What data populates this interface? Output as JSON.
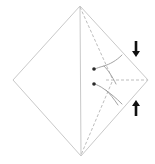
{
  "figure": {
    "title": "Origami fold step diagram",
    "caption": "Diamond-shaped paper with right flap folded to center",
    "background_color": "#ffffff",
    "canvas": {
      "width": 155,
      "height": 164
    }
  },
  "style": {
    "outline_color": "#c9c9c9",
    "crease_color": "#c9c9c9",
    "dashed_color": "#bdbdbd",
    "motion_color": "#9a9a9a",
    "arrow_color": "#111111",
    "outline_width": 1,
    "dash_pattern": "3 2"
  },
  "shape": {
    "name": "diamond",
    "label": "square rotated 45 degrees",
    "vertices": {
      "top": {
        "x": 80,
        "y": 6,
        "label": "top vertex"
      },
      "right": {
        "x": 148,
        "y": 80,
        "label": "right vertex"
      },
      "bottom": {
        "x": 81,
        "y": 156,
        "label": "bottom vertex"
      },
      "left": {
        "x": 13,
        "y": 80,
        "label": "left vertex"
      }
    },
    "points_path": "80,6 148,80 81,156 13,80"
  },
  "creases": [
    {
      "name": "vertical-center-crease",
      "label": "vertical center fold line",
      "style": "solid",
      "x1": 80,
      "y1": 6,
      "x2": 81,
      "y2": 156
    },
    {
      "name": "upper-diagonal-crease",
      "label": "upper dashed diagonal fold",
      "style": "dashed",
      "x1": 80,
      "y1": 7,
      "x2": 112,
      "y2": 78
    },
    {
      "name": "lower-diagonal-crease",
      "label": "lower dashed diagonal fold",
      "style": "dashed",
      "x1": 112,
      "y1": 82,
      "x2": 81,
      "y2": 155
    },
    {
      "name": "horizontal-dashed-crease",
      "label": "horizontal dashed fold to right vertex",
      "style": "dashed",
      "x1": 106,
      "y1": 80,
      "x2": 147,
      "y2": 80
    }
  ],
  "motion_arrows": [
    {
      "name": "upper-curved-fold-arrow",
      "label": "upper curved fold arrow pointing left",
      "path": "M 122 55 C 116 61 110 64 104 66 C 100 67 97 68 95 69",
      "head": {
        "x": 94,
        "y": 69,
        "r": 1.8,
        "label": "round arrow head"
      }
    },
    {
      "name": "upper-curved-fold-arrow-tail",
      "label": "upper curved arrow lower tail",
      "path": "M 104 66 C 108 70 112 76 116 84",
      "head": null
    },
    {
      "name": "lower-curved-fold-arrow",
      "label": "lower curved fold arrow pointing left",
      "path": "M 122 104 C 116 98 110 93 104 89 C 100 86 97 85 95 84",
      "head": {
        "x": 94,
        "y": 84,
        "r": 1.8,
        "label": "round arrow head"
      }
    },
    {
      "name": "lower-curved-fold-arrow-tail",
      "label": "lower curved arrow upper tail",
      "path": "M 106 90 C 110 94 114 99 118 105",
      "head": null
    }
  ],
  "direction_arrows": [
    {
      "name": "down-arrow",
      "label": "fold down",
      "direction": "down",
      "glyph": "↓",
      "x": 136,
      "y": 49,
      "shaft_width": 2.6,
      "length": 16,
      "head_width": 8,
      "head_length": 6
    },
    {
      "name": "up-arrow",
      "label": "fold up",
      "direction": "up",
      "glyph": "↑",
      "x": 136,
      "y": 108,
      "shaft_width": 2.6,
      "length": 16,
      "head_width": 8,
      "head_length": 6
    }
  ]
}
